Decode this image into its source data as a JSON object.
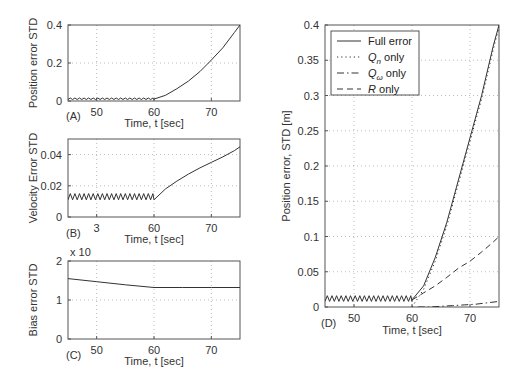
{
  "chart_data": [
    {
      "id": "A",
      "type": "line",
      "panel_label": "(A)",
      "title": "",
      "xlabel": "Time, t [sec]",
      "ylabel": "Position error STD",
      "xlim": [
        45,
        75
      ],
      "ylim": [
        0,
        0.4
      ],
      "xticks": [
        50,
        60,
        70
      ],
      "xtick_labels": [
        "50",
        "60",
        "70"
      ],
      "yticks": [
        0,
        0.2,
        0.4
      ],
      "ytick_labels": [
        "0",
        "0.2",
        "0.4"
      ],
      "grid": true,
      "series": [
        {
          "name": "Position error STD",
          "style": "solid",
          "sawtooth": {
            "from": 45,
            "to": 60,
            "low": 0.008,
            "high": 0.016,
            "period": 0.8
          },
          "x": [
            60,
            62,
            64,
            66,
            68,
            70,
            72,
            74,
            75
          ],
          "y": [
            0.01,
            0.03,
            0.065,
            0.105,
            0.155,
            0.215,
            0.28,
            0.36,
            0.4
          ]
        }
      ]
    },
    {
      "id": "B",
      "type": "line",
      "panel_label": "(B)",
      "title": "",
      "xlabel": "Time, t [sec]",
      "ylabel": "Velocity Error STD",
      "xlim": [
        45,
        75
      ],
      "ylim": [
        0,
        0.05
      ],
      "xticks": [
        50,
        60,
        70
      ],
      "xtick_labels": [
        "3",
        "60",
        "70"
      ],
      "yticks": [
        0,
        0.02,
        0.04
      ],
      "ytick_labels": [
        "0",
        "0.02",
        "0.04"
      ],
      "grid": true,
      "series": [
        {
          "name": "Velocity Error STD",
          "style": "solid",
          "sawtooth": {
            "from": 45,
            "to": 60,
            "low": 0.011,
            "high": 0.015,
            "period": 0.8
          },
          "x": [
            60,
            62,
            64,
            66,
            68,
            70,
            72,
            74,
            75
          ],
          "y": [
            0.011,
            0.018,
            0.023,
            0.0275,
            0.0315,
            0.035,
            0.0385,
            0.0425,
            0.045
          ]
        }
      ]
    },
    {
      "id": "C",
      "type": "line",
      "panel_label": "(C)",
      "title": "",
      "exponent_label": "x 10",
      "xlabel": "Time, t [sec]",
      "ylabel": "Bias error STD",
      "xlim": [
        45,
        75
      ],
      "ylim": [
        0,
        2
      ],
      "xticks": [
        50,
        60,
        70
      ],
      "xtick_labels": [
        "50",
        "60",
        "70"
      ],
      "yticks": [
        0,
        1,
        2
      ],
      "ytick_labels": [
        "0",
        "1",
        "2"
      ],
      "grid": true,
      "series": [
        {
          "name": "Bias error STD",
          "style": "solid",
          "x": [
            45,
            50,
            55,
            60,
            65,
            70,
            75
          ],
          "y": [
            1.55,
            1.47,
            1.39,
            1.32,
            1.32,
            1.32,
            1.32
          ]
        }
      ]
    },
    {
      "id": "D",
      "type": "line",
      "panel_label": "(D)",
      "title": "",
      "xlabel": "Time, t [sec]",
      "ylabel": "Position error, STD [m]",
      "xlim": [
        45,
        75
      ],
      "ylim": [
        0,
        0.4
      ],
      "xticks": [
        50,
        60,
        70
      ],
      "xtick_labels": [
        "50",
        "60",
        "70"
      ],
      "yticks": [
        0,
        0.05,
        0.1,
        0.15,
        0.2,
        0.25,
        0.3,
        0.35,
        0.4
      ],
      "ytick_labels": [
        "0",
        "0.05",
        "0.1",
        "0.15",
        "0.2",
        "0.25",
        "0.3",
        "0.35",
        "0.4"
      ],
      "grid": true,
      "legend_position": "upper left",
      "series": [
        {
          "name": "Full error",
          "style": "solid",
          "sawtooth": {
            "from": 45,
            "to": 60,
            "low": 0.008,
            "high": 0.016,
            "period": 0.8
          },
          "x": [
            60,
            62,
            64,
            66,
            68,
            70,
            72,
            74,
            75
          ],
          "y": [
            0.01,
            0.03,
            0.07,
            0.12,
            0.18,
            0.24,
            0.3,
            0.37,
            0.4
          ]
        },
        {
          "name": "Q_n only",
          "style": "dotted",
          "x": [
            60,
            62,
            64,
            66,
            68,
            70,
            72,
            74,
            75
          ],
          "y": [
            0.0,
            0.025,
            0.065,
            0.115,
            0.175,
            0.235,
            0.295,
            0.365,
            0.397
          ]
        },
        {
          "name": "Q_ω only",
          "style": "dashdot",
          "x": [
            61,
            63,
            65,
            67,
            69,
            71,
            73,
            75
          ],
          "y": [
            0.0,
            0.0,
            0.001,
            0.002,
            0.003,
            0.004,
            0.006,
            0.008
          ]
        },
        {
          "name": "R only",
          "style": "dashed",
          "x": [
            60,
            62,
            64,
            66,
            68,
            70,
            72,
            74,
            75
          ],
          "y": [
            0.01,
            0.02,
            0.03,
            0.042,
            0.055,
            0.065,
            0.078,
            0.092,
            0.1
          ]
        }
      ]
    }
  ],
  "legend": {
    "items": [
      {
        "label": "Full error",
        "sub": ""
      },
      {
        "label": "Q",
        "sub": "n",
        "suffix": " only"
      },
      {
        "label": "Q",
        "sub": "ω",
        "suffix": " only"
      },
      {
        "label": "R",
        "sub": "",
        "suffix": " only"
      }
    ]
  },
  "colors": {
    "line": "#333333",
    "axis": "#555555",
    "grid": "#aaaaaa"
  }
}
